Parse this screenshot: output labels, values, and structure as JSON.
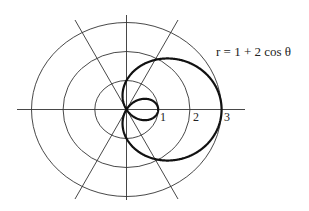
{
  "diagram": {
    "type": "polar-plot",
    "equation_label": "r = 1 + 2 cos θ",
    "equation": "r = 1 + 2 cos(theta)",
    "radial_tick_labels": [
      "1",
      "2",
      "3"
    ],
    "grid": {
      "circles": [
        1,
        2,
        3
      ],
      "radial_lines_degrees": [
        0,
        60,
        90,
        120
      ]
    },
    "curve": {
      "name": "limaçon with inner loop",
      "outer_loop_max_r": 3,
      "inner_loop_max_r": 1
    }
  }
}
